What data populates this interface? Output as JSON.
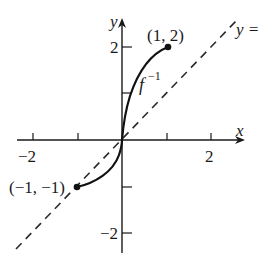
{
  "diagram": {
    "type": "function-graph",
    "axes": {
      "x_label": "x",
      "y_label": "y",
      "x_ticks": [
        -2,
        -1,
        1,
        2
      ],
      "y_ticks": [
        -2,
        -1,
        1,
        2
      ],
      "x_tick_labels": [
        "−2",
        "2"
      ],
      "y_tick_labels": [
        "2",
        "−2"
      ]
    },
    "curve": {
      "name": "f",
      "superscript": "−1",
      "start_point": {
        "x": -1,
        "y": -1,
        "label": "(−1, −1)"
      },
      "end_point": {
        "x": 1,
        "y": 2,
        "label": "(1, 2)"
      }
    },
    "reference_line": {
      "label": "y =",
      "style": "dashed"
    }
  }
}
